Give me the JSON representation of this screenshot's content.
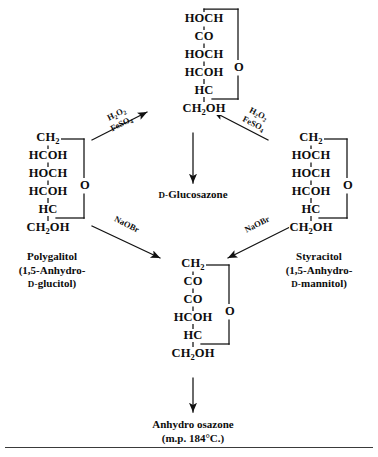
{
  "diagram": {
    "line_color": "#111111",
    "background": "#ffffff",
    "compounds": {
      "glucosazone": {
        "name": "D-Glucosazone",
        "name_smallcaps_prefix": "D-",
        "name_rest": "Glucosazone",
        "rows": [
          "HOCH",
          "CO",
          "HOCH",
          "HCOH",
          "HC",
          "CH2OH"
        ],
        "ring_oxygen": "O"
      },
      "polygalitol": {
        "name_line1": "Polygalitol",
        "name_line2": "(1,5-Anhydro-",
        "name_line3_prefix": "D-",
        "name_line3_rest": "glucitol)",
        "rows": [
          "CH2",
          "HCOH",
          "HOCH",
          "HCOH",
          "HC",
          "CH2OH"
        ],
        "ring_oxygen": "O"
      },
      "styracitol": {
        "name_line1": "Styracitol",
        "name_line2": "(1,5-Anhydro-",
        "name_line3_prefix": "D-",
        "name_line3_rest": "mannitol)",
        "rows": [
          "CH2",
          "HOCH",
          "HOCH",
          "HCOH",
          "HC",
          "CH2OH"
        ],
        "ring_oxygen": "O"
      },
      "anhydro_osazone": {
        "name_line1": "Anhydro osazone",
        "name_line2": "(m.p. 184°C.)",
        "rows": [
          "CH2",
          "CO",
          "CO",
          "HCOH",
          "HC",
          "CH2OH"
        ],
        "ring_oxygen": "O"
      }
    },
    "reagents": {
      "left_upper": {
        "line1": "H2O2",
        "line2": "FeSO4"
      },
      "right_upper": {
        "line1": "H2O2",
        "line2": "FeSO4"
      },
      "left_lower": {
        "line1": "NaOBr"
      },
      "right_lower": {
        "line1": "NaOBr"
      }
    },
    "arrows": [
      {
        "name": "polygalitol-to-glucosazone",
        "reagent": "H2O2 / FeSO4",
        "direction": "up-right"
      },
      {
        "name": "styracitol-to-glucosazone",
        "reagent": "H2O2 / FeSO4",
        "direction": "up-left"
      },
      {
        "name": "glucosazone-to-anhydro-osazone",
        "reagent": "",
        "direction": "down"
      },
      {
        "name": "polygalitol-to-anhydro-osazone",
        "reagent": "NaOBr",
        "direction": "down-right"
      },
      {
        "name": "styracitol-to-anhydro-osazone",
        "reagent": "NaOBr",
        "direction": "down-left"
      },
      {
        "name": "anhydro-osazone-to-caption",
        "reagent": "",
        "direction": "down"
      }
    ]
  }
}
